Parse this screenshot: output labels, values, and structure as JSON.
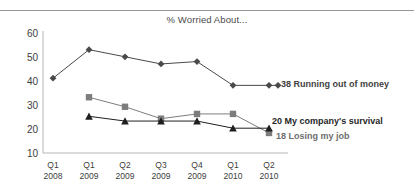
{
  "chart_data": {
    "type": "line",
    "title": "% Worried About...",
    "xlabel": "",
    "ylabel": "",
    "ylim": [
      10,
      60
    ],
    "yticks": [
      10,
      20,
      30,
      40,
      50,
      60
    ],
    "grid": false,
    "legend_position": "right-inline-end-labels",
    "categories": [
      "Q1 2008",
      "Q1 2009",
      "Q2 2009",
      "Q3 2009",
      "Q4 2009",
      "Q1 2010",
      "Q2 2010"
    ],
    "category_lines": [
      {
        "quarter": "Q1",
        "year": "2008"
      },
      {
        "quarter": "Q1",
        "year": "2009"
      },
      {
        "quarter": "Q2",
        "year": "2009"
      },
      {
        "quarter": "Q3",
        "year": "2009"
      },
      {
        "quarter": "Q4",
        "year": "2009"
      },
      {
        "quarter": "Q1",
        "year": "2010"
      },
      {
        "quarter": "Q2",
        "year": "2010"
      }
    ],
    "series": [
      {
        "name": "Running out of money",
        "marker": "diamond",
        "color": "#4a4a4a",
        "end_value": 38,
        "values": [
          41,
          53,
          50,
          47,
          48,
          38,
          38
        ]
      },
      {
        "name": "My company's survival",
        "marker": "square",
        "color": "#7d7d7d",
        "end_value": 20,
        "values": [
          null,
          33,
          29,
          24,
          26,
          26,
          18
        ]
      },
      {
        "name": "Losing my job",
        "marker": "triangle",
        "color": "#1f1f1f",
        "end_value": 18,
        "values": [
          null,
          25,
          23,
          23,
          23,
          20,
          20
        ]
      }
    ]
  },
  "labels": {
    "money": {
      "value": "38",
      "name": "Running out of money"
    },
    "survival": {
      "value": "20",
      "name": "My company's survival"
    },
    "job": {
      "value": "18",
      "name": "Losing my job"
    }
  },
  "axis": {
    "y": [
      "60",
      "50",
      "40",
      "30",
      "20",
      "10"
    ]
  }
}
